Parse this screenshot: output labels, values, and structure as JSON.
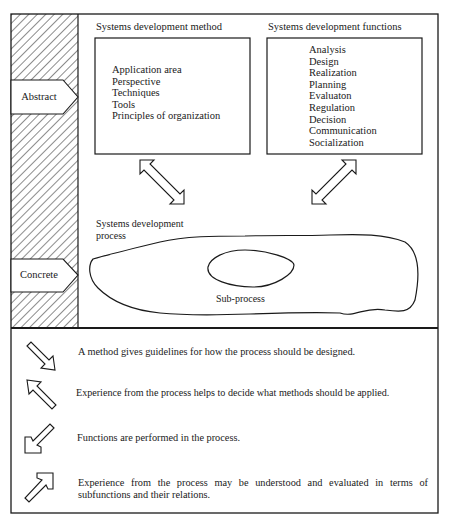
{
  "diagram": {
    "levels": {
      "abstract_label": "Abstract",
      "concrete_label": "Concrete"
    },
    "method_box": {
      "title": "Systems development method",
      "items": [
        "Application area",
        "Perspective",
        "Techniques",
        "Tools",
        "Principles of organization"
      ]
    },
    "functions_box": {
      "title": "Systems development functions",
      "items": [
        "Analysis",
        "Design",
        "Realization",
        "Planning",
        "Evaluaton",
        "Regulation",
        "Decision",
        "Communication",
        "Socialization"
      ]
    },
    "process": {
      "title_line1": "Systems development",
      "title_line2": "process",
      "subprocess_label": "Sub-process"
    },
    "arrows": [
      {
        "id": "method-process",
        "type": "double-headed",
        "direction": "diagonal NW-SE"
      },
      {
        "id": "functions-process",
        "type": "double-headed",
        "direction": "diagonal NE-SW"
      }
    ]
  },
  "legend": {
    "items": [
      {
        "icon": "arrow-down-right-icon",
        "text": "A method gives guidelines for how the process should be designed."
      },
      {
        "icon": "arrow-up-left-icon",
        "text": "Experience from the process helps to decide what methods should be applied."
      },
      {
        "icon": "arrow-down-left-icon",
        "text": "Functions are performed in the process."
      },
      {
        "icon": "arrow-up-right-icon",
        "text": "Experience from the process may be understood and evaluated in terms of subfunctions and their relations."
      }
    ]
  },
  "colors": {
    "ink": "#1a1a1a",
    "background": "#ffffff"
  }
}
